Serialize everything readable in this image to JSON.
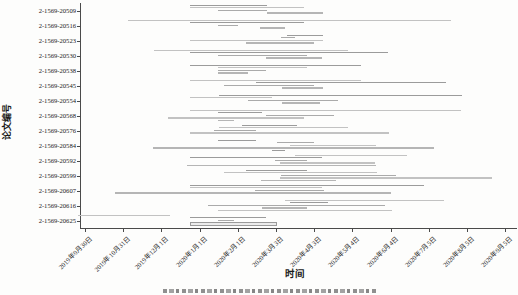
{
  "figure": {
    "background": "#fdfdfc",
    "axis_color": "#4a4a4a",
    "text_color": "#1a1a1a"
  },
  "axes": {
    "y_title": "论文编号",
    "x_title": "时间"
  },
  "chart_data": {
    "type": "gantt",
    "title": "",
    "xlabel": "时间",
    "ylabel": "论文编号",
    "x_domain": [
      "2019-09-26",
      "2020-09-12"
    ],
    "grid": false,
    "legend": "none",
    "bar_shades": [
      "#9b9b9b",
      "#c2c2c2",
      "#aaaaaa",
      "#b5b5b5"
    ],
    "x_ticks": [
      {
        "label": "2019年9月30日",
        "date": "2019-09-30"
      },
      {
        "label": "2019年10月31日",
        "date": "2019-10-31"
      },
      {
        "label": "2019年12月1日",
        "date": "2019-12-01"
      },
      {
        "label": "2020年1月1日",
        "date": "2020-01-01"
      },
      {
        "label": "2020年2月1日",
        "date": "2020-02-01"
      },
      {
        "label": "2020年3月3日",
        "date": "2020-03-03"
      },
      {
        "label": "2020年4月3日",
        "date": "2020-04-03"
      },
      {
        "label": "2020年5月4日",
        "date": "2020-05-04"
      },
      {
        "label": "2020年6月4日",
        "date": "2020-06-04"
      },
      {
        "label": "2020年7月5日",
        "date": "2020-07-05"
      },
      {
        "label": "2020年8月5日",
        "date": "2020-08-05"
      },
      {
        "label": "2020年9月5日",
        "date": "2020-09-05"
      }
    ],
    "papers": [
      {
        "id": "2-1569-20509",
        "segments": [
          {
            "start": "2019-12-24",
            "end": "2020-02-25",
            "shade": 0
          },
          {
            "start": "2019-12-24",
            "end": "2020-03-26",
            "shade": 1
          },
          {
            "start": "2020-01-16",
            "end": "2020-02-25",
            "shade": 2
          },
          {
            "start": "2020-02-25",
            "end": "2020-04-10",
            "shade": 3
          }
        ]
      },
      {
        "id": "2-1569-20516",
        "segments": [
          {
            "start": "2019-11-04",
            "end": "2020-07-23",
            "shade": 1
          },
          {
            "start": "2019-12-24",
            "end": "2020-03-26",
            "shade": 0
          },
          {
            "start": "2020-01-16",
            "end": "2020-02-01",
            "shade": 2
          },
          {
            "start": "2020-02-19",
            "end": "2020-03-10",
            "shade": 3
          }
        ]
      },
      {
        "id": "2-1569-20523",
        "segments": [
          {
            "start": "2020-03-12",
            "end": "2020-04-10",
            "shade": 0
          },
          {
            "start": "2020-03-07",
            "end": "2020-03-18",
            "shade": 2
          },
          {
            "start": "2019-12-24",
            "end": "2020-04-10",
            "shade": 1
          },
          {
            "start": "2020-02-08",
            "end": "2020-04-03",
            "shade": 3
          }
        ]
      },
      {
        "id": "2-1569-20530",
        "segments": [
          {
            "start": "2019-11-25",
            "end": "2020-04-30",
            "shade": 1
          },
          {
            "start": "2019-12-24",
            "end": "2020-06-02",
            "shade": 0
          },
          {
            "start": "2020-01-16",
            "end": "2020-03-28",
            "shade": 2
          },
          {
            "start": "2020-02-24",
            "end": "2020-04-09",
            "shade": 3
          }
        ]
      },
      {
        "id": "2-1569-20538",
        "segments": [
          {
            "start": "2019-12-24",
            "end": "2020-05-11",
            "shade": 0
          },
          {
            "start": "2020-01-16",
            "end": "2020-03-28",
            "shade": 1
          },
          {
            "start": "2020-01-16",
            "end": "2020-02-24",
            "shade": 2
          },
          {
            "start": "2020-01-16",
            "end": "2020-02-09",
            "shade": 3
          }
        ]
      },
      {
        "id": "2-1569-20545",
        "segments": [
          {
            "start": "2019-12-24",
            "end": "2020-05-11",
            "shade": 1
          },
          {
            "start": "2020-02-16",
            "end": "2020-07-19",
            "shade": 0
          },
          {
            "start": "2020-01-21",
            "end": "2020-04-03",
            "shade": 2
          },
          {
            "start": "2020-03-08",
            "end": "2020-04-10",
            "shade": 3
          }
        ]
      },
      {
        "id": "2-1569-20554",
        "segments": [
          {
            "start": "2020-01-17",
            "end": "2020-08-01",
            "shade": 0
          },
          {
            "start": "2019-12-24",
            "end": "2020-02-29",
            "shade": 1
          },
          {
            "start": "2020-02-09",
            "end": "2020-04-22",
            "shade": 2
          },
          {
            "start": "2020-03-08",
            "end": "2020-04-08",
            "shade": 3
          }
        ]
      },
      {
        "id": "2-1569-20568",
        "segments": [
          {
            "start": "2019-12-24",
            "end": "2020-07-31",
            "shade": 1
          },
          {
            "start": "2020-01-16",
            "end": "2020-02-21",
            "shade": 0
          },
          {
            "start": "2020-02-24",
            "end": "2020-04-19",
            "shade": 2
          },
          {
            "start": "2019-12-06",
            "end": "2020-03-26",
            "shade": 1
          },
          {
            "start": "2020-01-16",
            "end": "2020-01-29",
            "shade": 3
          }
        ]
      },
      {
        "id": "2-1569-20576",
        "segments": [
          {
            "start": "2020-02-04",
            "end": "2020-03-20",
            "shade": 0
          },
          {
            "start": "2020-01-17",
            "end": "2020-04-30",
            "shade": 1
          },
          {
            "start": "2020-01-13",
            "end": "2020-02-16",
            "shade": 2
          },
          {
            "start": "2019-12-24",
            "end": "2020-06-03",
            "shade": 1
          }
        ]
      },
      {
        "id": "2-1569-20584",
        "segments": [
          {
            "start": "2020-01-16",
            "end": "2020-02-16",
            "shade": 0
          },
          {
            "start": "2020-03-04",
            "end": "2020-04-03",
            "shade": 2
          },
          {
            "start": "2020-03-14",
            "end": "2020-05-23",
            "shade": 1
          },
          {
            "start": "2019-11-24",
            "end": "2020-07-09",
            "shade": 3
          },
          {
            "start": "2020-02-29",
            "end": "2020-03-10",
            "shade": 0
          }
        ]
      },
      {
        "id": "2-1569-20592",
        "segments": [
          {
            "start": "2020-03-18",
            "end": "2020-06-17",
            "shade": 1
          },
          {
            "start": "2019-12-24",
            "end": "2020-04-09",
            "shade": 0
          },
          {
            "start": "2020-03-02",
            "end": "2020-03-28",
            "shade": 2
          },
          {
            "start": "2020-03-06",
            "end": "2020-05-22",
            "shade": 1
          },
          {
            "start": "2019-12-22",
            "end": "2020-05-23",
            "shade": 3
          }
        ]
      },
      {
        "id": "2-1569-20599",
        "segments": [
          {
            "start": "2020-02-08",
            "end": "2020-03-28",
            "shade": 0
          },
          {
            "start": "2020-01-21",
            "end": "2020-05-24",
            "shade": 1
          },
          {
            "start": "2020-03-07",
            "end": "2020-06-08",
            "shade": 2
          },
          {
            "start": "2020-03-06",
            "end": "2020-08-25",
            "shade": 1
          },
          {
            "start": "2020-02-20",
            "end": "2020-04-21",
            "shade": 3
          }
        ]
      },
      {
        "id": "2-1569-20607",
        "segments": [
          {
            "start": "2019-12-24",
            "end": "2020-07-01",
            "shade": 0
          },
          {
            "start": "2019-12-24",
            "end": "2020-04-09",
            "shade": 1
          },
          {
            "start": "2020-02-15",
            "end": "2020-04-11",
            "shade": 2
          },
          {
            "start": "2019-10-24",
            "end": "2020-06-04",
            "shade": 3
          }
        ]
      },
      {
        "id": "2-1569-20616",
        "segments": [
          {
            "start": "2020-03-10",
            "end": "2020-07-17",
            "shade": 1
          },
          {
            "start": "2020-03-14",
            "end": "2020-04-14",
            "shade": 0
          },
          {
            "start": "2020-01-08",
            "end": "2020-05-30",
            "shade": 2
          },
          {
            "start": "2020-02-21",
            "end": "2020-03-28",
            "shade": 3
          },
          {
            "start": "2020-01-16",
            "end": "2020-06-05",
            "shade": 1
          }
        ]
      },
      {
        "id": "2-1569-20625",
        "segments": [
          {
            "start": "2019-09-24",
            "end": "2019-12-08",
            "shade": 1
          },
          {
            "start": "2019-12-24",
            "end": "2020-02-24",
            "shade": 0
          },
          {
            "start": "2020-01-16",
            "end": "2020-01-29",
            "shade": 2
          },
          {
            "start": "2019-12-24",
            "end": "2020-03-04",
            "shade": 3,
            "thick": true
          },
          {
            "start": "2020-02-01",
            "end": "2020-02-26",
            "shade": 0
          }
        ]
      }
    ]
  }
}
